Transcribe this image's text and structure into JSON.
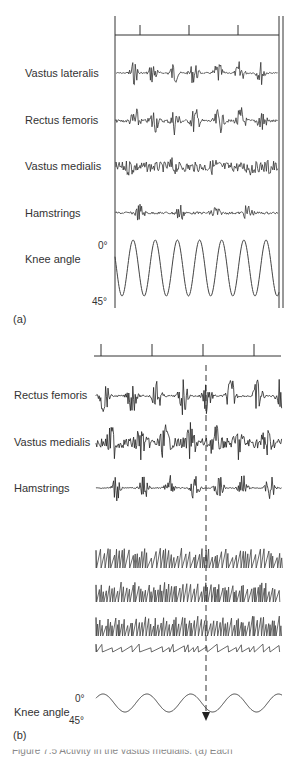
{
  "panel_a": {
    "label": "(a)",
    "traces": [
      {
        "name": "Vastus lateralis"
      },
      {
        "name": "Rectus femoris"
      },
      {
        "name": "Vastus medialis"
      },
      {
        "name": "Hamstrings"
      },
      {
        "name": "Knee angle"
      }
    ],
    "angle_top": "0°",
    "angle_bottom": "45°"
  },
  "panel_b": {
    "label": "(b)",
    "traces": [
      {
        "name": "Rectus femoris"
      },
      {
        "name": "Vastus medialis"
      },
      {
        "name": "Hamstrings"
      },
      {
        "name": "Knee angle"
      }
    ],
    "angle_top": "0°",
    "angle_bottom": "45°"
  },
  "caption": "Figure 7.5  Activity in the vastus medialis. (a) Each"
}
